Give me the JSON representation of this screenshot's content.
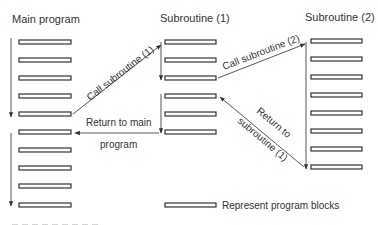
{
  "headings": {
    "main": "Main program",
    "sub1": "Subroutine (1)",
    "sub2": "Subroutine (2)"
  },
  "columns": {
    "main": {
      "x": 19,
      "width": 52,
      "block_y": [
        42,
        60,
        78,
        96,
        114,
        132,
        150,
        168,
        186,
        205
      ]
    },
    "sub1": {
      "x": 165,
      "width": 51,
      "block_y": [
        42,
        60,
        78,
        96,
        114,
        132
      ]
    },
    "sub2": {
      "x": 311,
      "width": 51,
      "block_y": [
        41,
        59,
        77,
        95,
        113,
        131,
        149,
        167
      ]
    }
  },
  "arrows": {
    "call_sub1": {
      "label": "Call subroutine (1)"
    },
    "call_sub2": {
      "label": "Call subroutine (2)"
    },
    "return_main": {
      "label_line1": "Return to main",
      "label_line2": "program"
    },
    "return_sub1": {
      "label_line1": "Return to",
      "label_line2": "subroutine (1)"
    }
  },
  "legend": {
    "label": "Represent program blocks"
  },
  "colors": {
    "stroke": "#333333",
    "background": "#ffffff"
  }
}
